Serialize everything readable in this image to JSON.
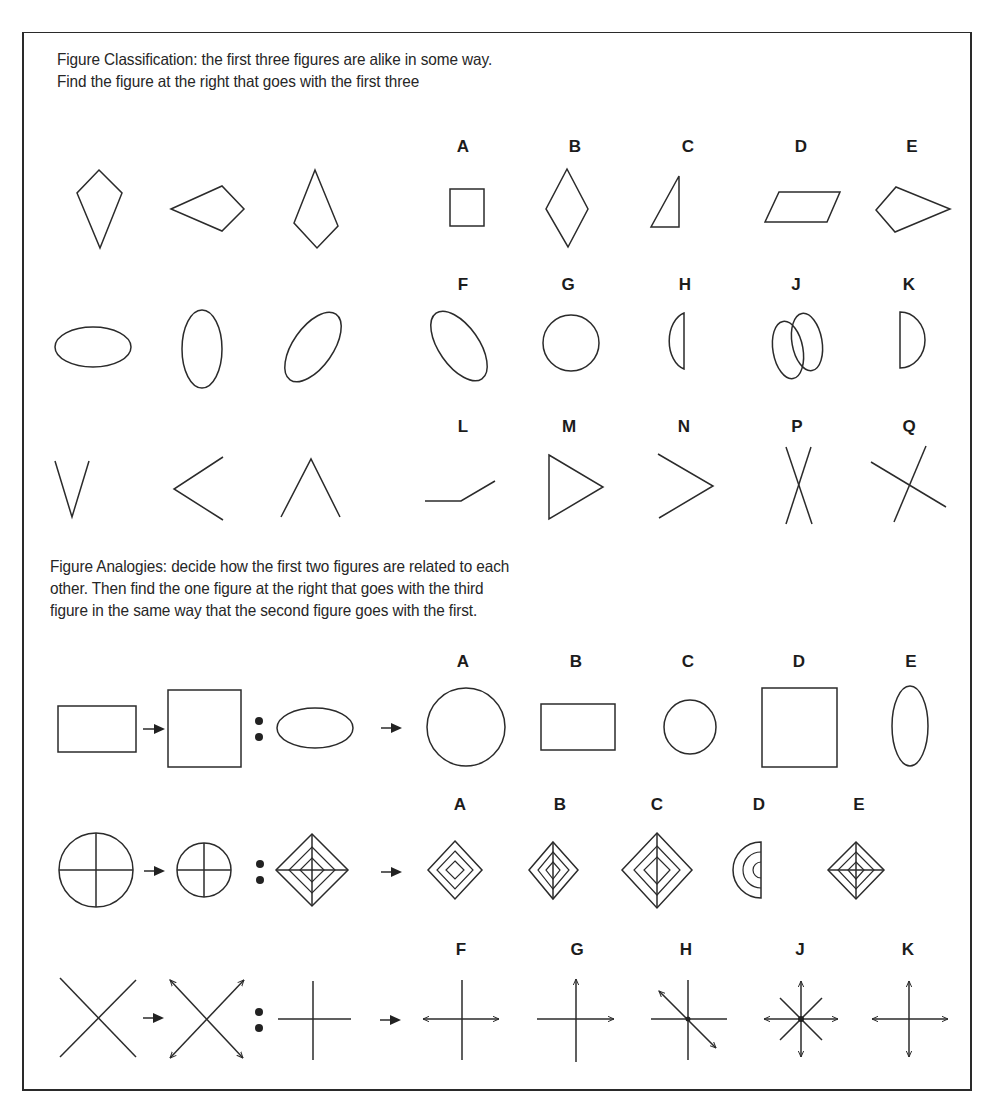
{
  "classification": {
    "instructions": [
      "Figure Classification: the first three figures are alike in some way.",
      "Find the figure at the right that goes with the first three"
    ],
    "rows": [
      {
        "item_figures": [
          "kite-pointing-down",
          "kite-pointing-left",
          "kite-pointing-up"
        ],
        "options": [
          {
            "label": "A",
            "figure": "square"
          },
          {
            "label": "B",
            "figure": "rhombus"
          },
          {
            "label": "C",
            "figure": "right-triangle"
          },
          {
            "label": "D",
            "figure": "parallelogram"
          },
          {
            "label": "E",
            "figure": "kite-pointing-right"
          }
        ]
      },
      {
        "item_figures": [
          "ellipse-horizontal",
          "ellipse-vertical",
          "ellipse-tilted-right"
        ],
        "options": [
          {
            "label": "F",
            "figure": "ellipse-tilted-left"
          },
          {
            "label": "G",
            "figure": "circle"
          },
          {
            "label": "H",
            "figure": "half-circle-left"
          },
          {
            "label": "J",
            "figure": "two-overlapping-ellipses"
          },
          {
            "label": "K",
            "figure": "half-circle-right"
          }
        ]
      },
      {
        "item_figures": [
          "angle-v-down",
          "angle-opening-right",
          "angle-opening-down"
        ],
        "options": [
          {
            "label": "L",
            "figure": "bent-line"
          },
          {
            "label": "M",
            "figure": "triangle-pointing-right"
          },
          {
            "label": "N",
            "figure": "angle-pointing-right"
          },
          {
            "label": "P",
            "figure": "narrow-cross"
          },
          {
            "label": "Q",
            "figure": "tilted-cross"
          }
        ]
      }
    ]
  },
  "analogies": {
    "instructions": [
      "Figure Analogies: decide how the first two figures are related to each",
      "other. Then find the one figure at the right that goes with the third",
      "figure in the same way  that  the second figure goes with the first."
    ],
    "rows": [
      {
        "item_figures": [
          "wide-rectangle",
          "tall-rectangle",
          "wide-ellipse"
        ],
        "options": [
          {
            "label": "A",
            "figure": "large-tall-ellipse"
          },
          {
            "label": "B",
            "figure": "wide-rectangle"
          },
          {
            "label": "C",
            "figure": "small-circle"
          },
          {
            "label": "D",
            "figure": "tall-rectangle"
          },
          {
            "label": "E",
            "figure": "narrow-tall-ellipse"
          }
        ]
      },
      {
        "item_figures": [
          "large-circle-with-cross",
          "small-circle-with-cross",
          "large-concentric-diamonds-with-cross"
        ],
        "options": [
          {
            "label": "A",
            "figure": "concentric-diamonds-no-lines"
          },
          {
            "label": "B",
            "figure": "concentric-diamonds-vertical-line"
          },
          {
            "label": "C",
            "figure": "large-concentric-diamonds-vertical-line"
          },
          {
            "label": "D",
            "figure": "concentric-half-circles"
          },
          {
            "label": "E",
            "figure": "small-concentric-diamonds-with-cross"
          }
        ]
      },
      {
        "item_figures": [
          "x-lines",
          "x-lines-with-arrowheads",
          "plus-lines"
        ],
        "options": [
          {
            "label": "F",
            "figure": "plus-horizontal-arrows"
          },
          {
            "label": "G",
            "figure": "plus-right-and-up-arrows"
          },
          {
            "label": "H",
            "figure": "plus-with-diagonal-arrow"
          },
          {
            "label": "J",
            "figure": "star-with-arrows"
          },
          {
            "label": "K",
            "figure": "plus-four-arrows"
          }
        ]
      }
    ],
    "relation_symbols": {
      "transform": "arrow-right",
      "analogy": "colon"
    }
  },
  "style": {
    "ink": "#2b2b2b",
    "paper": "#ffffff"
  }
}
